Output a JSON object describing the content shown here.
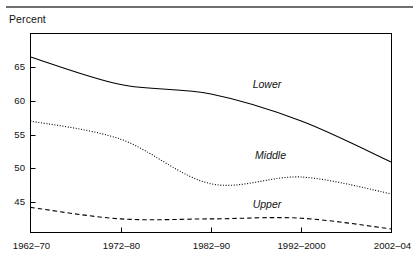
{
  "figure": {
    "top_rule_color": "#6e6e6e",
    "axis_color": "#000000",
    "background": "#ffffff"
  },
  "chart_data": {
    "type": "line",
    "title": "",
    "subtitle": "",
    "xlabel": "",
    "ylabel": "Percent",
    "categories": [
      "1962–70",
      "1972–80",
      "1982–90",
      "1992–2000",
      "2002–04"
    ],
    "ytick_labels": [
      "65",
      "60",
      "55",
      "50",
      "45"
    ],
    "yticks": [
      65,
      60,
      55,
      50,
      45
    ],
    "ylim": [
      40.5,
      68.5
    ],
    "grid": false,
    "legend": "inline-series-labels",
    "series": [
      {
        "name": "Lower",
        "style": "solid",
        "color": "#000000",
        "values": [
          66.5,
          62.4,
          61.0,
          57.0,
          50.9
        ],
        "label_x_category_fraction": 2.62,
        "label_value": 62.4
      },
      {
        "name": "Middle",
        "style": "dotted",
        "color": "#000000",
        "values": [
          57.0,
          54.3,
          47.7,
          48.7,
          46.2
        ],
        "label_x_category_fraction": 2.66,
        "label_value": 51.8
      },
      {
        "name": "Upper",
        "style": "dashed",
        "color": "#000000",
        "values": [
          44.2,
          42.5,
          42.5,
          42.6,
          41.0
        ],
        "label_x_category_fraction": 2.62,
        "label_value": 44.6
      }
    ]
  }
}
